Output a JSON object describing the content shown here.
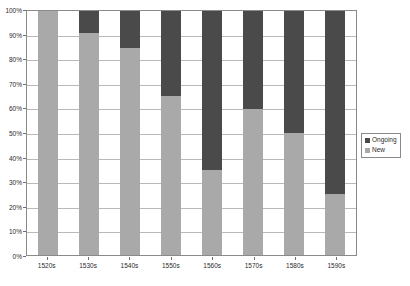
{
  "chart_data": {
    "type": "bar",
    "subtype": "stacked-100-percent",
    "title": "",
    "xlabel": "",
    "ylabel": "",
    "categories": [
      "1520s",
      "1530s",
      "1540s",
      "1550s",
      "1560s",
      "1570s",
      "1580s",
      "1590s"
    ],
    "series": [
      {
        "name": "Ongoing",
        "color": "#4a4a4a",
        "values": [
          0,
          9,
          15,
          35,
          65,
          40,
          50,
          75
        ]
      },
      {
        "name": "New",
        "color": "#a9a9a9",
        "values": [
          100,
          91,
          85,
          65,
          35,
          60,
          50,
          25
        ]
      }
    ],
    "ylim": [
      0,
      100
    ],
    "yticks": [
      0,
      10,
      20,
      30,
      40,
      50,
      60,
      70,
      80,
      90,
      100
    ],
    "ytick_labels": [
      "0%",
      "10%",
      "20%",
      "30%",
      "40%",
      "50%",
      "60%",
      "70%",
      "80%",
      "90%",
      "100%"
    ],
    "grid": true,
    "grid_axis": "y",
    "legend_position": "right",
    "legend_entries": [
      {
        "label": "Ongoing",
        "color": "#4a4a4a"
      },
      {
        "label": "New",
        "color": "#a9a9a9"
      }
    ]
  }
}
